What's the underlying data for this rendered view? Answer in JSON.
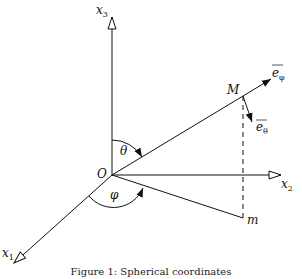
{
  "figure": {
    "caption": "Figure 1: Spherical coordinates",
    "origin_label": "O",
    "axes": [
      {
        "id": "x1",
        "label": "x",
        "subscript": "1"
      },
      {
        "id": "x2",
        "label": "x",
        "subscript": "2"
      },
      {
        "id": "x3",
        "label": "x",
        "subscript": "3"
      }
    ],
    "point_M": "M",
    "point_m": "m",
    "angles": {
      "theta": "θ",
      "phi": "φ"
    },
    "vectors": {
      "e_phi": {
        "base": "e",
        "subscript": "φ"
      },
      "e_theta": {
        "base": "e",
        "subscript": "θ"
      }
    },
    "colors": {
      "stroke": "#111111",
      "background": "#ffffff"
    }
  }
}
